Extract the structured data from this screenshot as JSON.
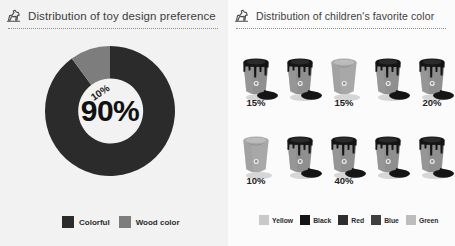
{
  "left": {
    "title": "Distribution of toy design preference",
    "icon": "toy-horse-icon",
    "center_label": "90%",
    "slice_label": "10%",
    "legend": [
      {
        "label": "Colorful",
        "color": "#2b2b2b"
      },
      {
        "label": "Wood color",
        "color": "#7d7d7d"
      }
    ]
  },
  "right": {
    "title": "Distribution of children's favorite color",
    "icon": "toy-horse-icon",
    "legend": [
      {
        "label": "Yellow",
        "color": "#c9c9c9"
      },
      {
        "label": "Black",
        "color": "#141414"
      },
      {
        "label": "Red",
        "color": "#2e2e2e"
      },
      {
        "label": "Blue",
        "color": "#3f3f3f"
      },
      {
        "label": "Green",
        "color": "#bdbdbd"
      }
    ],
    "rows": [
      {
        "buckets": [
          {
            "filled": true,
            "color": "#8f8f8f"
          },
          {
            "filled": true,
            "color": "#8f8f8f"
          },
          {
            "filled": false,
            "color": "#a8a8a8"
          },
          {
            "filled": true,
            "color": "#8f8f8f"
          },
          {
            "filled": true,
            "color": "#8f8f8f"
          }
        ],
        "labels": [
          "15%",
          "",
          "15%",
          "",
          "20%"
        ]
      },
      {
        "buckets": [
          {
            "filled": false,
            "color": "#a8a8a8"
          },
          {
            "filled": true,
            "color": "#8f8f8f"
          },
          {
            "filled": true,
            "color": "#8f8f8f"
          },
          {
            "filled": true,
            "color": "#8f8f8f"
          },
          {
            "filled": true,
            "color": "#8f8f8f"
          }
        ],
        "labels": [
          "10%",
          "",
          "40%",
          "",
          ""
        ]
      }
    ]
  },
  "chart_data": [
    {
      "type": "pie",
      "title": "Distribution of toy design preference",
      "categories": [
        "Colorful",
        "Wood color"
      ],
      "values": [
        90,
        10
      ],
      "unit": "%",
      "donut": true,
      "legend_position": "bottom",
      "colors": [
        "#2b2b2b",
        "#7d7d7d"
      ],
      "data_labels": [
        "90%",
        "10%"
      ]
    },
    {
      "type": "bar",
      "subtype": "pictogram",
      "title": "Distribution of children's favorite color",
      "categories": [
        "Yellow",
        "Black",
        "Red",
        "Blue",
        "Green"
      ],
      "values": [
        15,
        15,
        20,
        10,
        40
      ],
      "unit": "%",
      "icon": "paint-bucket",
      "icons_per_row": 5,
      "total_icons": 10,
      "legend_position": "bottom",
      "xlabel": "",
      "ylabel": "",
      "data_labels": [
        "15%",
        "15%",
        "20%",
        "10%",
        "40%"
      ]
    }
  ]
}
